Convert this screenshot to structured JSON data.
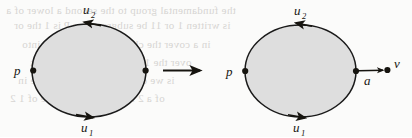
{
  "figure": {
    "caption": "",
    "background_color": "#fbfbfa",
    "ink_color": "#16140f",
    "fill_color": "#dedede",
    "stroke_color": "#1a1a1a"
  },
  "left_diagram": {
    "name": "loop-with-two-edges",
    "basepoint_label": "p",
    "top_edge_label": "u",
    "top_edge_subscript": "2",
    "bottom_edge_label": "u",
    "bottom_edge_subscript": "1",
    "top_arrow_direction": "leftward",
    "bottom_arrow_direction": "rightward",
    "vertices": [
      "p",
      ""
    ],
    "ellipse": {
      "cx": 89,
      "cy": 70.5,
      "rx": 57,
      "ry": 46.5
    }
  },
  "transform_arrow": {
    "name": "implies-arrow",
    "direction": "right",
    "label": ""
  },
  "right_diagram": {
    "name": "loop-with-two-edges-and-pendant-edge",
    "basepoint_label": "p",
    "top_edge_label": "u",
    "top_edge_subscript": "2",
    "bottom_edge_label": "u",
    "bottom_edge_subscript": "1",
    "pendant_edge_label": "a",
    "pendant_vertex_label": "v",
    "top_arrow_direction": "leftward",
    "bottom_arrow_direction": "rightward",
    "pendant_arrow_direction": "rightward",
    "ellipse": {
      "cx": 300.5,
      "cy": 71,
      "rx": 55.5,
      "ry": 46
    }
  },
  "ghost_text": {
    "lines": [
      "the fundamental group to the second a lower of a",
      "is written 1 or 11 be subgroup for P is 1 the or",
      "in a cover the class of edges all this into",
      "over the 1 in a loop and every link",
      "is we can see the lift and this e in",
      "of a 2 in see that the space of 1 2"
    ]
  }
}
